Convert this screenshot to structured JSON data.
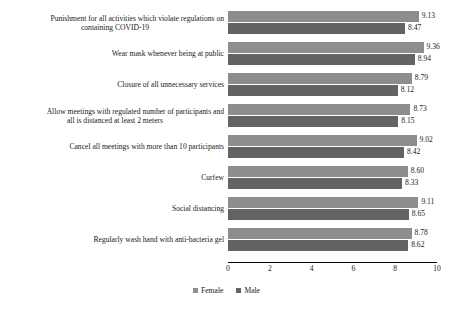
{
  "chart_data": {
    "type": "bar",
    "orientation": "horizontal",
    "title": "",
    "subtitle": "",
    "xlabel": "",
    "ylabel": "",
    "xlim": [
      0,
      10
    ],
    "xticks": [
      0,
      2,
      4,
      6,
      8,
      10
    ],
    "xtick_labels": [
      "0",
      "2",
      "4",
      "6",
      "8",
      "10"
    ],
    "grid": false,
    "legend_position": "bottom",
    "categories": [
      "Punishment for all activities which violate regulations on containing COVID-19",
      "Wear mask whenever being at public",
      "Closure of all unnecessary services",
      "Allow meetings with regulated number of participants and all is distanced at least 2 meters",
      "Cancel all meetings with more than 10 participants",
      "Curfew",
      "Social distancing",
      "Regularly wash hand with  anti-bacteria gel"
    ],
    "category_lines": [
      [
        "Punishment for all activities which violate regulations on",
        "containing COVID-19"
      ],
      [
        "Wear mask whenever being at public"
      ],
      [
        "Closure of all unnecessary services"
      ],
      [
        "Allow meetings with regulated number of participants and",
        "all is distanced at least 2 meters"
      ],
      [
        "Cancel all meetings with more than 10 participants"
      ],
      [
        "Curfew"
      ],
      [
        "Social distancing"
      ],
      [
        "Regularly wash hand with  anti-bacteria gel"
      ]
    ],
    "series": [
      {
        "name": "Female",
        "color": "#8d8d8d",
        "values": [
          9.13,
          9.36,
          8.79,
          8.73,
          9.02,
          8.6,
          9.11,
          8.78
        ],
        "labels": [
          "9.13",
          "9.36",
          "8.79",
          "8.73",
          "9.02",
          "8.60",
          "9.11",
          "8.78"
        ]
      },
      {
        "name": "Male",
        "color": "#636363",
        "values": [
          8.47,
          8.94,
          8.12,
          8.15,
          8.42,
          8.33,
          8.65,
          8.62
        ],
        "labels": [
          "8.47",
          "8.94",
          "8.12",
          "8.15",
          "8.42",
          "8.33",
          "8.65",
          "8.62"
        ]
      }
    ],
    "legend": [
      {
        "label": "Female",
        "color": "#8d8d8d"
      },
      {
        "label": "Male",
        "color": "#636363"
      }
    ]
  }
}
